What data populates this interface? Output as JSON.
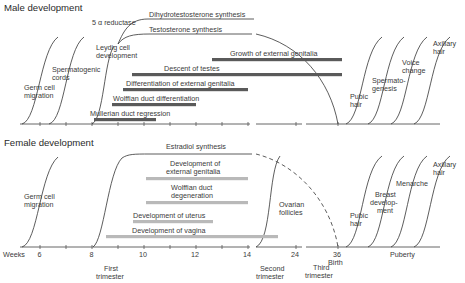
{
  "male": {
    "title": "Male development",
    "early_curves": [
      {
        "label": [
          "Germ cell",
          "migration"
        ]
      },
      {
        "label": [
          "Spermatogenic",
          "cords"
        ]
      },
      {
        "label": [
          "Leydig cell",
          "development"
        ]
      }
    ],
    "hormone_lines": [
      {
        "label": "5 α reductase"
      },
      {
        "label": "Dihydrotestosterone synthesis"
      },
      {
        "label": "Testosterone synthesis"
      }
    ],
    "bars": [
      {
        "label": "Growth of external genitalia",
        "start_week": 12.6,
        "end": "36"
      },
      {
        "label": "Descent of testes",
        "start_week": 9.0,
        "end": "36"
      },
      {
        "label": "Differentiation of external genitalia",
        "start_week": 8.9,
        "end_week": 13.9
      },
      {
        "label": "Wolffian duct differentiation",
        "start_week": 8.5,
        "end_week": 11.9
      },
      {
        "label": "Mullerian duct regression",
        "start_week": 8.1,
        "end_week": 10.5
      }
    ],
    "puberty_curves": [
      {
        "label": [
          "Pubic",
          "hair"
        ]
      },
      {
        "label": [
          "Spermato-",
          "genesis"
        ]
      },
      {
        "label": [
          "Voice",
          "change"
        ]
      },
      {
        "label": [
          "Axillary",
          "hair"
        ]
      }
    ]
  },
  "female": {
    "title": "Female development",
    "early_curves": [
      {
        "label": [
          "Germ cell",
          "migration"
        ]
      }
    ],
    "hormone_lines": [
      {
        "label": "Estradiol synthesis"
      }
    ],
    "bars": [
      {
        "label": [
          "Development of",
          "external genitalia"
        ],
        "start_week": 10.0,
        "end_week": 14.0
      },
      {
        "label": [
          "Wolffian duct",
          "degeneration"
        ],
        "start_week": 10.0,
        "end_week": 14.0
      },
      {
        "label": "Development of uterus",
        "start_week": 9.5,
        "end_week": 12.6
      },
      {
        "label": "Development of vagina",
        "start_week": 8.5,
        "end": "~22"
      }
    ],
    "other_curves": [
      {
        "label": [
          "Ovarian",
          "follicles"
        ]
      }
    ],
    "puberty_curves": [
      {
        "label": [
          "Pubic",
          "hair"
        ]
      },
      {
        "label": [
          "Breast",
          "develop-",
          "ment"
        ]
      },
      {
        "label": [
          "Menarche"
        ]
      },
      {
        "label": [
          "Axillary",
          "hair"
        ]
      }
    ]
  },
  "axis": {
    "weeks_label": "Weeks",
    "ticks": [
      "6",
      "8",
      "10",
      "12",
      "14",
      "24",
      "36"
    ],
    "birth_label": "Birth",
    "puberty_label": "Puberty",
    "trimesters": [
      [
        "First",
        "trimester"
      ],
      [
        "Second",
        "trimester"
      ],
      [
        "Third",
        "trimester"
      ]
    ]
  },
  "colors": {
    "male_bar": "#5a5a5a",
    "female_bar": "#b9b9b9",
    "line": "#333333"
  }
}
